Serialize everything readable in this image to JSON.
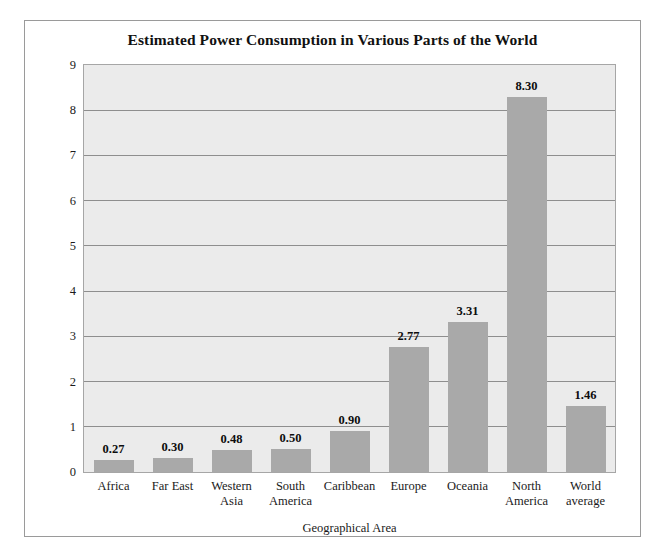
{
  "chart_data": {
    "type": "bar",
    "title": "Estimated Power Consumption in Various Parts of the World",
    "xlabel": "Geographical Area",
    "ylabel": "Power (kilowatts) per Person",
    "categories": [
      "Africa",
      "Far East",
      "Western\nAsia",
      "South\nAmerica",
      "Caribbean",
      "Europe",
      "Oceania",
      "North\nAmerica",
      "World\naverage"
    ],
    "values": [
      0.27,
      0.3,
      0.48,
      0.5,
      0.9,
      2.77,
      3.31,
      8.3,
      1.46
    ],
    "value_labels": [
      "0.27",
      "0.30",
      "0.48",
      "0.50",
      "0.90",
      "2.77",
      "3.31",
      "8.30",
      "1.46"
    ],
    "ylim": [
      0,
      9
    ],
    "yticks": [
      0,
      1,
      2,
      3,
      4,
      5,
      6,
      7,
      8,
      9
    ],
    "ytick_labels": [
      "0",
      "1",
      "2",
      "3",
      "4",
      "5",
      "6",
      "7",
      "8",
      "9"
    ],
    "grid": true,
    "legend": null,
    "colors": {
      "bar": "#a9a9a9",
      "plot_background": "#ebebeb",
      "gridline": "#8e8e8e",
      "frame": "#9a9a9a",
      "text": "#1a1a1a",
      "page_background": "#ffffff"
    }
  }
}
